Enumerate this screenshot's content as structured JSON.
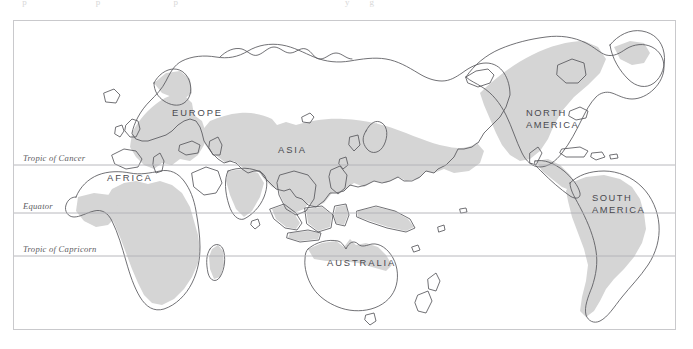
{
  "page": {
    "background_color": "#ffffff",
    "width": 693,
    "height": 349,
    "clipped_header_remnant": "     p               p                p                                     y    g"
  },
  "map": {
    "frame": {
      "border_color": "#c9c9cc",
      "background_color": "#ffffff"
    },
    "projection": "pacific-centered world map",
    "colors": {
      "land_outline": "#57575c",
      "range_shading": "#d5d5d5",
      "land_fill": "#ffffff",
      "latitude_line": "#b0b0b5",
      "label_text": "#4a4a50",
      "lat_label_text": "#5d5d62"
    },
    "latitude_lines": [
      {
        "id": "tropic-of-cancer",
        "label": "Tropic of Cancer",
        "y": 144,
        "label_x": 9,
        "label_y": 140
      },
      {
        "id": "equator",
        "label": "Equator",
        "y": 192,
        "label_x": 9,
        "label_y": 188
      },
      {
        "id": "tropic-of-capricorn",
        "label": "Tropic of Capricorn",
        "y": 235,
        "label_x": 9,
        "label_y": 231
      }
    ],
    "continent_labels": [
      {
        "id": "europe",
        "lines": [
          "EUROPE"
        ],
        "x": 158,
        "y": 95
      },
      {
        "id": "asia",
        "lines": [
          "ASIA"
        ],
        "x": 264,
        "y": 132
      },
      {
        "id": "africa",
        "lines": [
          "AFRICA"
        ],
        "x": 93,
        "y": 160
      },
      {
        "id": "australia",
        "lines": [
          "AUSTRALIA"
        ],
        "x": 313,
        "y": 245
      },
      {
        "id": "north-america",
        "lines": [
          "NORTH",
          "AMERICA"
        ],
        "x": 512,
        "y": 95
      },
      {
        "id": "south-america",
        "lines": [
          "SOUTH",
          "AMERICA"
        ],
        "x": 578,
        "y": 180
      }
    ]
  }
}
